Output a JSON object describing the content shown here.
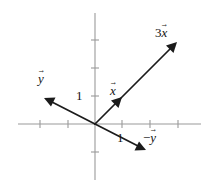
{
  "figure": {
    "name": "vector-scaling-diagram",
    "width": 215,
    "height": 188,
    "background_color": "#ffffff"
  },
  "axes": {
    "axis_color": "#9a9a9a",
    "origin": {
      "x": 95,
      "y": 124
    },
    "tick_spacing_px": 28,
    "x_axis": {
      "x_start": 18,
      "x_end": 201,
      "y": 124
    },
    "y_axis": {
      "x": 95,
      "y_start": 13,
      "y_end": 180
    },
    "x_ticks": [
      40,
      68,
      122,
      150,
      178
    ],
    "y_ticks": [
      40,
      68,
      96,
      152
    ],
    "tick_half_length_px": 4
  },
  "scale_labels": [
    {
      "id": "y-unit-label",
      "text": "1",
      "x": 76,
      "y": 89,
      "axis": "y"
    },
    {
      "id": "x-unit-label",
      "text": "1",
      "x": 117,
      "y": 131,
      "axis": "x"
    }
  ],
  "vectors": [
    {
      "id": "vector-3x",
      "label_coefficient": "3",
      "label_sign": "",
      "label_symbol": "x",
      "label_text": "3x",
      "from": {
        "x": 95,
        "y": 124
      },
      "to": {
        "x": 177,
        "y": 42
      },
      "color": "#1b1b1b",
      "label_position": {
        "x": 155,
        "y": 26
      }
    },
    {
      "id": "vector-x",
      "label_coefficient": "",
      "label_sign": "",
      "label_symbol": "x",
      "label_text": "x",
      "from": {
        "x": 95,
        "y": 124
      },
      "to": {
        "x": 122,
        "y": 97
      },
      "color": "#1b1b1b",
      "label_position": {
        "x": 110,
        "y": 84
      }
    },
    {
      "id": "vector-y",
      "label_coefficient": "",
      "label_sign": "",
      "label_symbol": "y",
      "label_text": "y",
      "from": {
        "x": 95,
        "y": 124
      },
      "to": {
        "x": 44,
        "y": 98
      },
      "color": "#1b1b1b",
      "label_position": {
        "x": 38,
        "y": 72
      }
    },
    {
      "id": "vector-negative-y",
      "label_coefficient": "",
      "label_sign": "−",
      "label_symbol": "y",
      "label_text": "−y",
      "from": {
        "x": 95,
        "y": 124
      },
      "to": {
        "x": 146,
        "y": 150
      },
      "color": "#1b1b1b",
      "label_position": {
        "x": 143,
        "y": 131
      }
    }
  ]
}
